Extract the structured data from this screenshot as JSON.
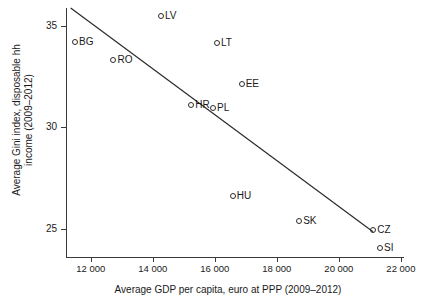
{
  "chart_data": {
    "type": "scatter",
    "title": "",
    "xlabel": "Average GDP per capita, euro at PPP (2009–2012)",
    "ylabel": "Average Gini index, disposable hh income (2009–2012)",
    "xlim": [
      11200,
      22100
    ],
    "ylim": [
      23.6,
      35.9
    ],
    "xticks": [
      12000,
      14000,
      16000,
      18000,
      20000,
      22000
    ],
    "xtick_labels": [
      "12 000",
      "14 000",
      "16 000",
      "18 000",
      "20 000",
      "22 000"
    ],
    "yticks": [
      25,
      30,
      35
    ],
    "ytick_labels": [
      "25",
      "30",
      "35"
    ],
    "grid": false,
    "legend": null,
    "marker": "open-circle",
    "point_color": "#2b2b2b",
    "line_color": "#2b2b2b",
    "points": [
      {
        "label": "BG",
        "x": 11490,
        "y": 34.2
      },
      {
        "label": "RO",
        "x": 12730,
        "y": 33.35
      },
      {
        "label": "LV",
        "x": 14260,
        "y": 35.5
      },
      {
        "label": "LT",
        "x": 16070,
        "y": 34.15
      },
      {
        "label": "EE",
        "x": 16865,
        "y": 32.15
      },
      {
        "label": "HR",
        "x": 15240,
        "y": 31.1
      },
      {
        "label": "PL",
        "x": 15940,
        "y": 30.95
      },
      {
        "label": "HU",
        "x": 16575,
        "y": 26.6
      },
      {
        "label": "SK",
        "x": 18720,
        "y": 25.4
      },
      {
        "label": "CZ",
        "x": 21110,
        "y": 24.95
      },
      {
        "label": "SI",
        "x": 21330,
        "y": 24.05
      }
    ],
    "trend_line": {
      "type": "linear-fit",
      "x_start": 11350,
      "y_start": 35.9,
      "x_end": 21100,
      "y_end": 24.85
    }
  }
}
